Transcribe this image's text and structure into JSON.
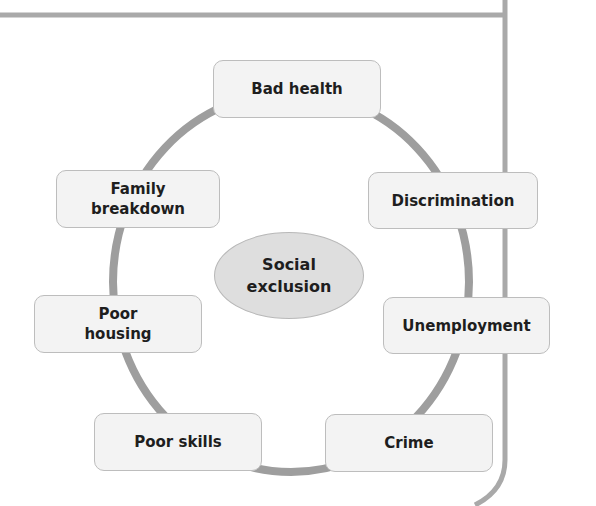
{
  "diagram": {
    "center": {
      "label": "Social\nexclusion"
    },
    "nodes": [
      {
        "id": "bad-health",
        "label": "Bad health"
      },
      {
        "id": "discrimination",
        "label": "Discrimination"
      },
      {
        "id": "unemployment",
        "label": "Unemployment"
      },
      {
        "id": "crime",
        "label": "Crime"
      },
      {
        "id": "poor-skills",
        "label": "Poor skills"
      },
      {
        "id": "poor-housing",
        "label": "Poor\nhousing"
      },
      {
        "id": "family-breakdown",
        "label": "Family\nbreakdown"
      }
    ]
  },
  "colors": {
    "ring": "#9e9e9e",
    "frame": "#a9a9a9",
    "node_fill": "#f3f3f3",
    "node_border": "#bdbdbd",
    "center_fill": "#dedede",
    "text": "#1e1e1e"
  }
}
